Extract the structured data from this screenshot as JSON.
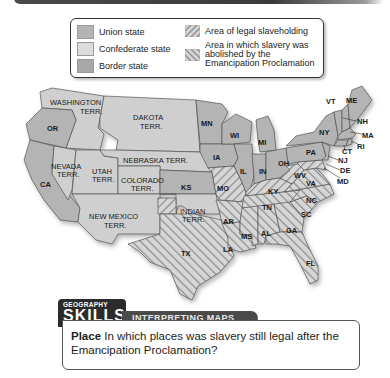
{
  "colors": {
    "union": "#b4b4b4",
    "confederate": "#d8d8d8",
    "border": "#a8a8a8",
    "territory": "#cfcfcf",
    "hatch_line": "#8a8a8a",
    "header_dark": "#2b2b2b",
    "banner_dark": "#4a4a4a"
  },
  "legend": {
    "items": [
      {
        "label": "Union state",
        "pattern": "union"
      },
      {
        "label": "Confederate state",
        "pattern": "confederate"
      },
      {
        "label": "Border state",
        "pattern": "border"
      },
      {
        "label": "Area of legal slaveholding",
        "pattern": "hatch-forward"
      },
      {
        "label": "Area in which slavery was abolished by the Emancipation Proclamation",
        "pattern": "hatch-back"
      }
    ],
    "item5_lines": [
      "Area in which slavery was",
      "abolished by the",
      "Emancipation Proclamation"
    ]
  },
  "map": {
    "labels": {
      "washington": [
        "WASHINGTON",
        "TERR."
      ],
      "dakota": [
        "DAKOTA",
        "TERR."
      ],
      "or": "OR",
      "nevada": [
        "NEVADA",
        "TERR."
      ],
      "utah": [
        "UTAH",
        "TERR."
      ],
      "nebraska": "NEBRASKA TERR.",
      "colorado": [
        "COLORADO",
        "TERR."
      ],
      "ca": "CA",
      "ks": "KS",
      "new_mexico": [
        "NEW MEXICO",
        "TERR."
      ],
      "indian": [
        "INDIAN",
        "TERR."
      ],
      "tx": "TX",
      "mn": "MN",
      "wi": "WI",
      "mi": "MI",
      "ia": "IA",
      "il": "IL",
      "in": "IN",
      "oh": "OH",
      "mo": "MO",
      "ky": "KY",
      "ar": "AR",
      "la": "LA",
      "ms": "MS",
      "al": "AL",
      "ga": "GA",
      "fl": "FL",
      "tn": "TN",
      "sc": "SC",
      "nc": "NC",
      "va": "VA",
      "wv": "WV",
      "md": "MD",
      "de": "DE",
      "nj": "NJ",
      "pa": "PA",
      "ny": "NY",
      "ct": "CT",
      "ri": "RI",
      "ma": "MA",
      "nh": "NH",
      "vt": "VT",
      "me": "ME"
    }
  },
  "skills": {
    "kicker": "GEOGRAPHY",
    "title": "SKILLS",
    "banner": "INTERPRETING MAPS",
    "question_lead": "Place",
    "question_text": " In which places was slavery still legal after the Emancipation Proclamation?"
  }
}
